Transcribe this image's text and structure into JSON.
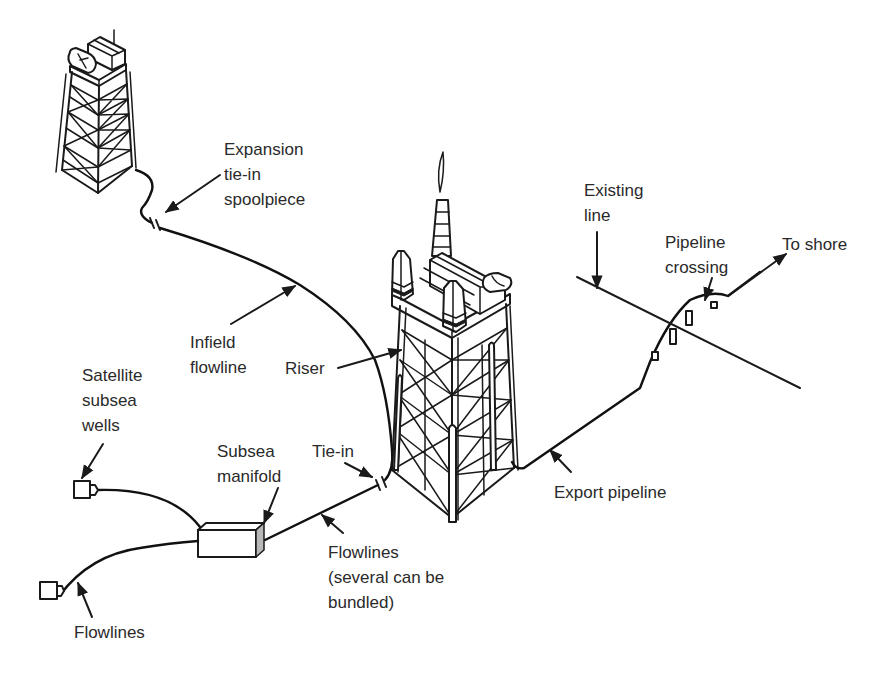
{
  "diagram": {
    "colors": {
      "line": "#1a1a1a",
      "text": "#2a2a2a",
      "manifold_side": "#b8b8b8",
      "background": "#ffffff"
    },
    "components": [
      "remote-platform",
      "main-platform",
      "satellite-well-1",
      "satellite-well-2",
      "subsea-manifold",
      "infield-flowline",
      "riser",
      "export-pipeline",
      "existing-line",
      "pipeline-crossing-supports"
    ],
    "labels": {
      "expansion": "Expansion\ntie-in\nspoolpiece",
      "infield": "Infield\nflowline",
      "riser": "Riser",
      "satellite": "Satellite\nsubsea\nwells",
      "manifold": "Subsea\nmanifold",
      "tiein": "Tie-in",
      "flowlines_bundled": "Flowlines\n(several can be\nbundled)",
      "flowlines": "Flowlines",
      "export": "Export pipeline",
      "existing": "Existing\nline",
      "crossing": "Pipeline\ncrossing",
      "shore": "To shore"
    }
  }
}
